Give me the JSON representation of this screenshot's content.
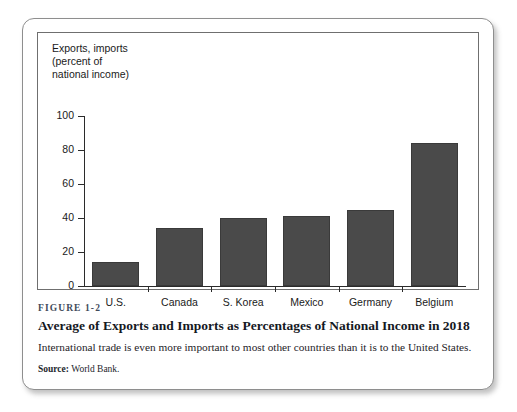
{
  "figure": {
    "number": "FIGURE 1-2",
    "title": "Average of Exports and Imports as Percentages of National Income in 2018",
    "description": "International trade is even more important to most other countries than it is to the United States.",
    "source_label": "Source:",
    "source_text": "World Bank."
  },
  "chart_data": {
    "type": "bar",
    "title": "",
    "ylabel": "Exports, imports\n(percent of\nnational income)",
    "xlabel": "",
    "categories": [
      "U.S.",
      "Canada",
      "S. Korea",
      "Mexico",
      "Germany",
      "Belgium"
    ],
    "values": [
      14,
      34,
      40,
      41,
      45,
      84
    ],
    "ylim": [
      0,
      100
    ],
    "yticks": [
      0,
      20,
      40,
      60,
      80,
      100
    ],
    "ytick_labels": [
      "0",
      "20",
      "40",
      "60",
      "80",
      "100"
    ],
    "grid": false,
    "legend": null,
    "bar_color": "#4a4a4a",
    "axis_color": "#2b2b2b"
  }
}
